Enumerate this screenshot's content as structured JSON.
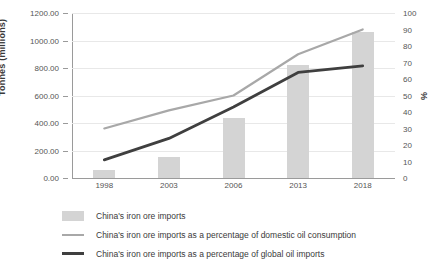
{
  "chart_data": {
    "type": "bar",
    "title": "",
    "categories": [
      "1998",
      "2003",
      "2006",
      "2013",
      "2018"
    ],
    "xlabel": "",
    "ylabel": "Tonnes (millions)",
    "y2label": "%",
    "ylim": [
      0,
      1200
    ],
    "ytick_step": 200,
    "y2lim": [
      0,
      100
    ],
    "y2tick_step": 10,
    "grid": true,
    "legend_position": "bottom-left",
    "yticks": [
      "0.00",
      "200.00",
      "400.00",
      "600.00",
      "800.00",
      "1000.00",
      "1200.00"
    ],
    "y2ticks": [
      "0",
      "10",
      "20",
      "30",
      "40",
      "50",
      "60",
      "70",
      "80",
      "90",
      "100"
    ],
    "series": [
      {
        "name": "China's iron ore imports",
        "type": "bar",
        "axis": "left",
        "unit": "Tonnes (millions)",
        "color": "#d4d4d4",
        "values": [
          55,
          150,
          440,
          820,
          1060
        ]
      },
      {
        "name": "China's iron ore imports as a percentage of domestic oil consumption",
        "type": "line",
        "axis": "right",
        "unit": "%",
        "color": "#a8a8a8",
        "values": [
          30,
          41,
          50,
          75,
          90
        ]
      },
      {
        "name": "China's iron ore imports as a percentage of global oil imports",
        "type": "line",
        "axis": "right",
        "unit": "%",
        "color": "#3f3f3f",
        "values": [
          11,
          24,
          43,
          64,
          68
        ]
      }
    ]
  },
  "legend": {
    "items": [
      {
        "label": "China's iron ore imports",
        "marker": "box-swatch",
        "color": "#d4d4d4"
      },
      {
        "label": "China's iron ore imports as a percentage of domestic oil consumption",
        "marker": "line-swatch-light",
        "color": "#a8a8a8"
      },
      {
        "label": "China's iron ore imports as a percentage of global oil imports",
        "marker": "line-swatch-dark",
        "color": "#3f3f3f"
      }
    ]
  }
}
